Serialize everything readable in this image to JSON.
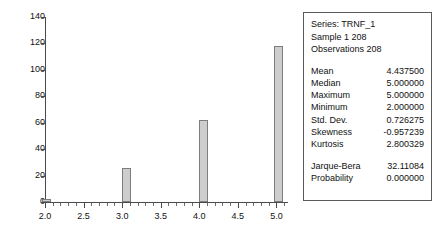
{
  "chart_data": {
    "type": "bar",
    "title": "",
    "xlabel": "",
    "ylabel": "",
    "xlim": [
      2.0,
      5.15
    ],
    "ylim": [
      0,
      140
    ],
    "ytick_labels": [
      "0",
      "20",
      "40",
      "60",
      "80",
      "100",
      "120",
      "140"
    ],
    "ytick_values": [
      0,
      20,
      40,
      60,
      80,
      100,
      120,
      140
    ],
    "xtick_labels": [
      "2.0",
      "2.5",
      "3.0",
      "3.5",
      "4.0",
      "4.5",
      "5.0"
    ],
    "xtick_values": [
      2.0,
      2.5,
      3.0,
      3.5,
      4.0,
      4.5,
      5.0
    ],
    "minor_tick_step": 0.1,
    "grid": false,
    "legend": "none",
    "bar_fill": "#cdcdcd",
    "bar_edge": "#7d7d7d",
    "x": [
      2.02,
      3.05,
      4.05,
      5.03
    ],
    "values": [
      2,
      26,
      62,
      118
    ],
    "bars": [
      {
        "label": "2.0",
        "x": 2.02,
        "value": 2
      },
      {
        "label": "3.0",
        "x": 3.05,
        "value": 26
      },
      {
        "label": "4.0",
        "x": 4.05,
        "value": 62
      },
      {
        "label": "5.0",
        "x": 5.03,
        "value": 118
      }
    ]
  },
  "stats": {
    "series_line": "Series: TRNF_1",
    "sample_line": "Sample 1 208",
    "observations_line": "Observations 208",
    "rows": [
      {
        "key": "Mean",
        "value": "4.437500"
      },
      {
        "key": "Median",
        "value": "5.000000"
      },
      {
        "key": "Maximum",
        "value": "5.000000"
      },
      {
        "key": "Minimum",
        "value": "2.000000"
      },
      {
        "key": "Std. Dev.",
        "value": "0.726275"
      },
      {
        "key": "Skewness",
        "value": "-0.957239"
      },
      {
        "key": "Kurtosis",
        "value": "2.800329"
      }
    ],
    "test_rows": [
      {
        "key": "Jarque-Bera",
        "value": "32.11084"
      },
      {
        "key": "Probability",
        "value": "0.000000"
      }
    ]
  }
}
